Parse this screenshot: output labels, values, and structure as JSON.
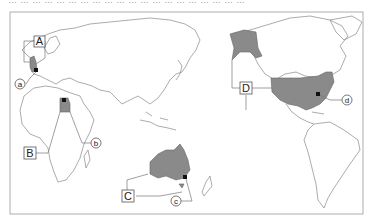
{
  "header": {
    "clipped_text": "……………………………………………………"
  },
  "map": {
    "projection": "pacific-centered world map",
    "frame": {
      "x": 10,
      "y": 12,
      "width": 353,
      "height": 202
    },
    "highlight_color": "#8a8a8a",
    "countries": [
      {
        "label": "A",
        "region": "United Kingdom",
        "city_label": "a"
      },
      {
        "label": "B",
        "region": "Egypt",
        "city_label": "b"
      },
      {
        "label": "C",
        "region": "Australia",
        "city_label": "c"
      },
      {
        "label": "D",
        "region": "United States",
        "city_label": "d"
      }
    ],
    "labels": {
      "A": "A",
      "B": "B",
      "C": "C",
      "D": "D",
      "a": "a",
      "b": "b",
      "c": "c",
      "d": "d"
    }
  }
}
